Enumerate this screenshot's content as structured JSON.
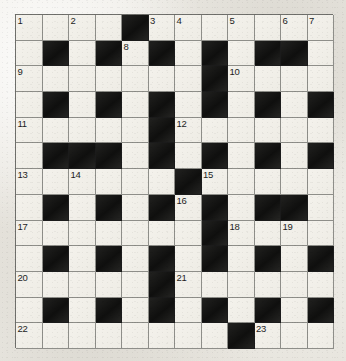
{
  "puzzle": {
    "title": "Crossword Grid",
    "type": "crossword",
    "rows": 13,
    "cols": 12,
    "colors": {
      "white_cell": "#f1efe9",
      "black_cell": "#1b1b1b",
      "grid_line": "#8e8e89",
      "page_background": "#eceae4",
      "number_text": "#1d1d1d"
    },
    "grid": [
      [
        "white",
        "white",
        "white",
        "white",
        "black",
        "white",
        "white",
        "white",
        "white",
        "white",
        "white",
        "white"
      ],
      [
        "white",
        "black",
        "white",
        "black",
        "white",
        "black",
        "white",
        "black",
        "white",
        "black",
        "black",
        "white"
      ],
      [
        "white",
        "white",
        "white",
        "white",
        "white",
        "white",
        "white",
        "black",
        "white",
        "white",
        "white",
        "white"
      ],
      [
        "white",
        "black",
        "white",
        "black",
        "white",
        "black",
        "white",
        "black",
        "white",
        "black",
        "white",
        "black"
      ],
      [
        "white",
        "white",
        "white",
        "white",
        "white",
        "black",
        "white",
        "white",
        "white",
        "white",
        "white",
        "white"
      ],
      [
        "white",
        "black",
        "black",
        "black",
        "white",
        "black",
        "white",
        "black",
        "white",
        "black",
        "white",
        "black"
      ],
      [
        "white",
        "white",
        "white",
        "white",
        "white",
        "white",
        "black",
        "white",
        "white",
        "white",
        "white",
        "white"
      ],
      [
        "white",
        "black",
        "white",
        "black",
        "white",
        "black",
        "white",
        "black",
        "white",
        "black",
        "black",
        "white"
      ],
      [
        "white",
        "white",
        "white",
        "white",
        "white",
        "white",
        "white",
        "black",
        "white",
        "white",
        "white",
        "white"
      ],
      [
        "white",
        "black",
        "white",
        "black",
        "white",
        "black",
        "white",
        "black",
        "white",
        "black",
        "white",
        "black"
      ],
      [
        "white",
        "white",
        "white",
        "white",
        "white",
        "black",
        "white",
        "white",
        "white",
        "white",
        "white",
        "white"
      ],
      [
        "white",
        "black",
        "white",
        "black",
        "white",
        "black",
        "white",
        "black",
        "white",
        "black",
        "white",
        "black"
      ],
      [
        "white",
        "white",
        "white",
        "white",
        "white",
        "white",
        "white",
        "white",
        "black",
        "white",
        "white",
        "white"
      ]
    ],
    "numbers": [
      {
        "row": 1,
        "col": 1,
        "label": "1"
      },
      {
        "row": 1,
        "col": 3,
        "label": "2"
      },
      {
        "row": 1,
        "col": 6,
        "label": "3"
      },
      {
        "row": 1,
        "col": 7,
        "label": "4"
      },
      {
        "row": 1,
        "col": 9,
        "label": "5"
      },
      {
        "row": 1,
        "col": 11,
        "label": "6"
      },
      {
        "row": 1,
        "col": 12,
        "label": "7"
      },
      {
        "row": 2,
        "col": 5,
        "label": "8"
      },
      {
        "row": 3,
        "col": 1,
        "label": "9"
      },
      {
        "row": 3,
        "col": 9,
        "label": "10"
      },
      {
        "row": 5,
        "col": 1,
        "label": "11"
      },
      {
        "row": 5,
        "col": 7,
        "label": "12"
      },
      {
        "row": 7,
        "col": 1,
        "label": "13"
      },
      {
        "row": 7,
        "col": 3,
        "label": "14"
      },
      {
        "row": 7,
        "col": 8,
        "label": "15"
      },
      {
        "row": 8,
        "col": 7,
        "label": "16"
      },
      {
        "row": 9,
        "col": 1,
        "label": "17"
      },
      {
        "row": 9,
        "col": 9,
        "label": "18"
      },
      {
        "row": 9,
        "col": 11,
        "label": "19"
      },
      {
        "row": 11,
        "col": 1,
        "label": "20"
      },
      {
        "row": 11,
        "col": 7,
        "label": "21"
      },
      {
        "row": 13,
        "col": 1,
        "label": "22"
      },
      {
        "row": 13,
        "col": 10,
        "label": "23"
      }
    ],
    "entries": []
  }
}
